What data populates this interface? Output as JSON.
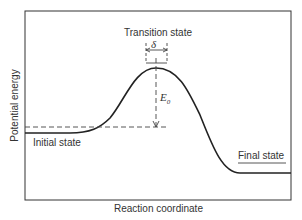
{
  "diagram": {
    "type": "energy-profile",
    "axes": {
      "x_label": "Reaction coordinate",
      "y_label": "Potential energy"
    },
    "labels": {
      "transition_state": "Transition state",
      "initial_state": "Initial state",
      "final_state": "Final state",
      "delta": "δ",
      "activation_energy": "E",
      "activation_energy_sub": "0"
    },
    "colors": {
      "curve": "#222222",
      "frame": "#333333",
      "dashed": "#444444"
    }
  }
}
